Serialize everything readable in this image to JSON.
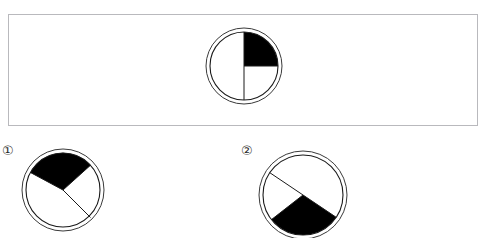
{
  "page": {
    "width": 487,
    "height": 238,
    "background_color": "#ffffff",
    "ink_color": "#000000",
    "line_color": "#2a2a2a",
    "panel_border_color": "#b9b9bd"
  },
  "top_cropped_text": {
    "note": "row of clipped character descenders along the very top edge; illegible",
    "fragments": [
      {
        "text": "—",
        "x": 14
      },
      {
        "text": "——",
        "x": 78
      },
      {
        "text": "— —",
        "x": 118
      },
      {
        "text": "—— —",
        "x": 196
      },
      {
        "text": "— — ——",
        "x": 252
      },
      {
        "text": "——",
        "x": 322
      },
      {
        "text": "—— ——",
        "x": 396
      },
      {
        "text": "— —",
        "x": 452
      }
    ]
  },
  "panel": {
    "x": 8,
    "y": 14,
    "width": 470,
    "height": 112,
    "border_color": "#b9b9bd"
  },
  "figures": [
    {
      "id": "question-figure",
      "label": "",
      "caption": "",
      "center": {
        "x": 40,
        "y": 39
      },
      "outer_radius": 38,
      "inner_radius": 34,
      "double_ring": true,
      "shaded_wedges": [
        {
          "start_deg": 0,
          "end_deg": 90,
          "fill": "#000000"
        }
      ],
      "radius_lines_deg": [
        0,
        90,
        270
      ],
      "shaded_fraction": "1/4"
    },
    {
      "id": "option-1-figure",
      "label": "①",
      "caption": "",
      "center": {
        "x": 42,
        "y": 42
      },
      "outer_radius": 41,
      "inner_radius": 37,
      "double_ring": true,
      "shaded_wedges": [
        {
          "start_deg": 42,
          "end_deg": 152,
          "fill": "#000000"
        }
      ],
      "radius_lines_deg": [
        42,
        152,
        222
      ],
      "shaded_fraction": "1/4"
    },
    {
      "id": "option-2-figure",
      "label": "②",
      "caption": "",
      "center": {
        "x": 45,
        "y": 45
      },
      "outer_radius": 44,
      "inner_radius": 40,
      "double_ring": true,
      "shaded_wedges": [
        {
          "start_deg": 218,
          "end_deg": 326,
          "fill": "#000000"
        }
      ],
      "radius_lines_deg": [
        218,
        326,
        146
      ],
      "shaded_fraction": "1/4"
    }
  ],
  "labels": {
    "option_one": "①",
    "option_two": "②"
  }
}
